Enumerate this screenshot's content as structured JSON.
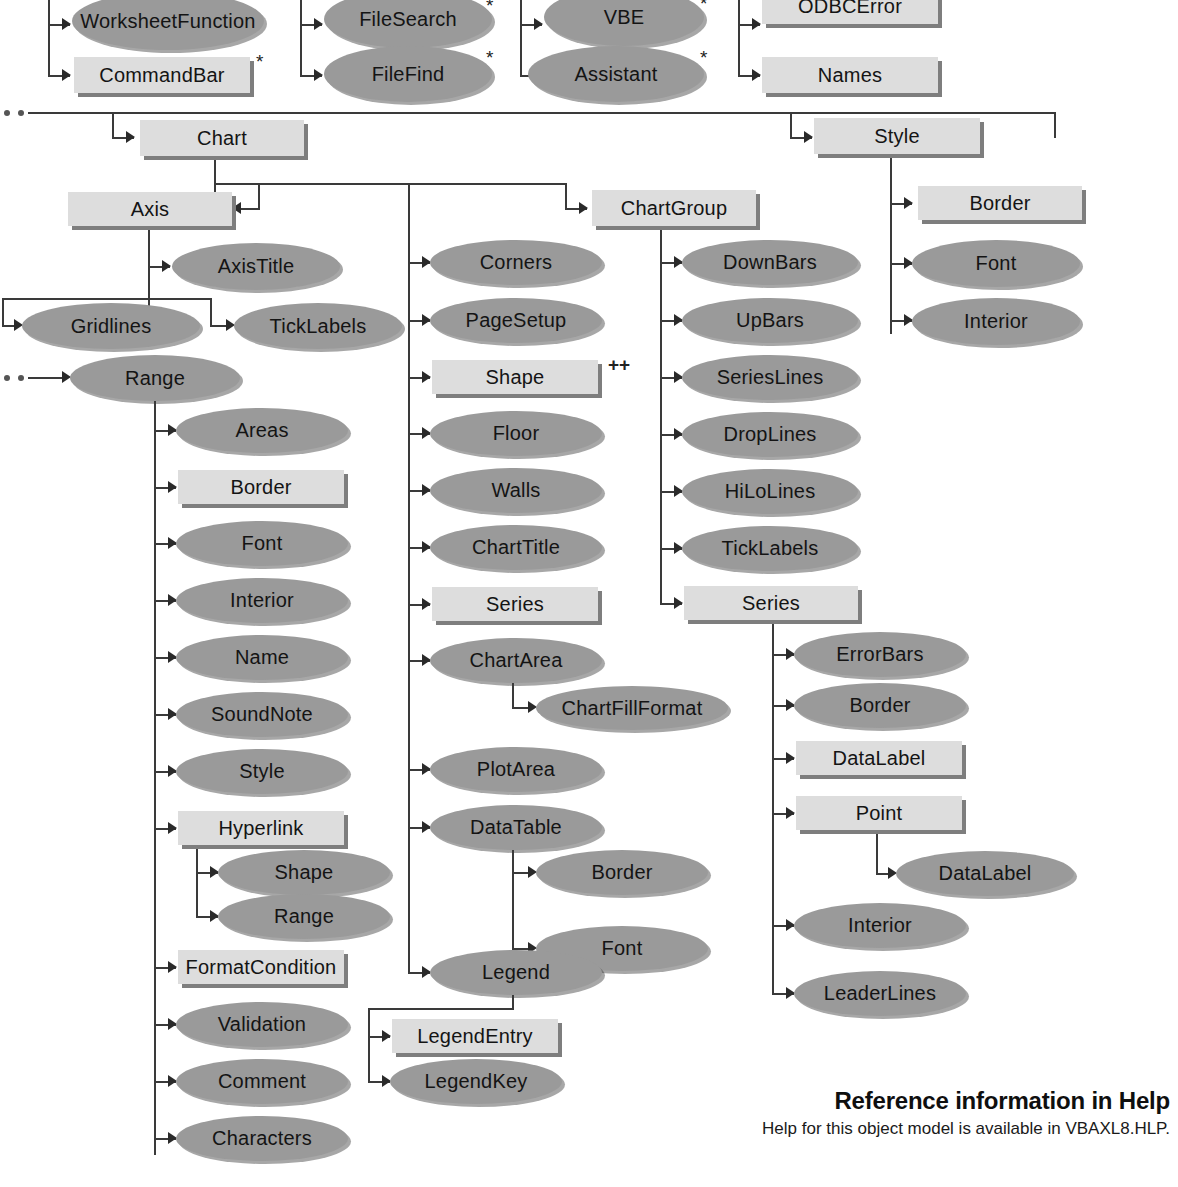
{
  "diagram": {
    "colors": {
      "ellipse_fill": "#9a9a9a",
      "rect_fill": "#dddddd",
      "line": "#3a3a3a",
      "shadow": "#7e7e7e",
      "background": "#ffffff"
    },
    "markers": {
      "star": "*",
      "plusplus": "++"
    }
  },
  "nodes": {
    "worksheet_function": "WorksheetFunction",
    "command_bar": "CommandBar",
    "file_search": "FileSearch",
    "file_find": "FileFind",
    "vbe": "VBE",
    "assistant": "Assistant",
    "odbc_error": "ODBCError",
    "names": "Names",
    "chart": "Chart",
    "style_top": "Style",
    "axis": "Axis",
    "chart_group": "ChartGroup",
    "border_style": "Border",
    "font_style": "Font",
    "interior_style": "Interior",
    "axis_title": "AxisTitle",
    "tick_labels_axis": "TickLabels",
    "gridlines": "Gridlines",
    "range": "Range",
    "areas": "Areas",
    "border_range": "Border",
    "font_range": "Font",
    "interior_range": "Interior",
    "name_range": "Name",
    "sound_note": "SoundNote",
    "style_range": "Style",
    "hyperlink": "Hyperlink",
    "shape_hyperlink": "Shape",
    "range_hyperlink": "Range",
    "format_condition": "FormatCondition",
    "validation": "Validation",
    "comment": "Comment",
    "characters": "Characters",
    "corners": "Corners",
    "page_setup": "PageSetup",
    "shape_chart": "Shape",
    "floor": "Floor",
    "walls": "Walls",
    "chart_title": "ChartTitle",
    "series_chart": "Series",
    "chart_area": "ChartArea",
    "chart_fill_format": "ChartFillFormat",
    "plot_area": "PlotArea",
    "data_table": "DataTable",
    "border_datatable": "Border",
    "font_datatable": "Font",
    "legend": "Legend",
    "legend_entry": "LegendEntry",
    "legend_key": "LegendKey",
    "down_bars": "DownBars",
    "up_bars": "UpBars",
    "series_lines": "SeriesLines",
    "drop_lines": "DropLines",
    "hi_lo_lines": "HiLoLines",
    "tick_labels_cg": "TickLabels",
    "series_cg": "Series",
    "error_bars": "ErrorBars",
    "border_series": "Border",
    "data_label_series": "DataLabel",
    "point": "Point",
    "data_label_point": "DataLabel",
    "interior_series": "Interior",
    "leader_lines": "LeaderLines"
  },
  "help": {
    "title": "Reference information in Help",
    "subtitle": "Help for this object model is available in VBAXL8.HLP."
  }
}
